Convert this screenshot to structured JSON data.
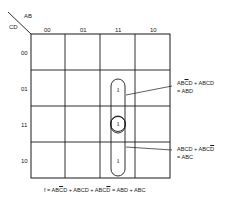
{
  "kmap": {
    "axis_col_var": "AB",
    "axis_row_var": "CD",
    "col_labels": [
      "00",
      "01",
      "11",
      "10"
    ],
    "row_labels": [
      "00",
      "01",
      "11",
      "10"
    ],
    "cells": {
      "r01_c11": "1",
      "r11_c11": "1",
      "r10_c11": "1"
    },
    "line_color": "#1a1a1a"
  },
  "annotations": {
    "top": {
      "line1_part1": "AB",
      "line1_part1_bar": "C",
      "line1_part1_end": "D + ABCD",
      "line2": "= ABD"
    },
    "bottom": {
      "line1_start": "ABCD + ABC",
      "line1_bar": "D",
      "line2": "= ABC"
    }
  },
  "equation": {
    "prefix": "f = AB",
    "bar1": "C",
    "mid1": "D + ABCD + ABC",
    "bar2": "D",
    "suffix": " = ABD + ABC"
  }
}
